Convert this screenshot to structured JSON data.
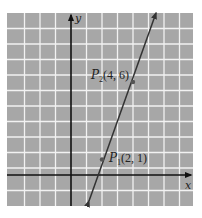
{
  "figure": {
    "type": "coordinate-plane-line",
    "colors": {
      "grid_background": "#a7a7a7",
      "grid_lines": "#f2f2f2",
      "axes": "#111111",
      "line": "#333333",
      "point": "#555555",
      "text": "#222222"
    },
    "axes": {
      "x_label": "x",
      "y_label": "y",
      "x_range": [
        -4,
        8
      ],
      "y_range": [
        -2,
        10
      ],
      "grid_step": 1
    },
    "points": [
      {
        "name": "P",
        "subscript": "1",
        "coords": "(2, 1)",
        "x": 2,
        "y": 1
      },
      {
        "name": "P",
        "subscript": "2",
        "coords": "(4, 6)",
        "x": 4,
        "y": 6
      }
    ],
    "line": {
      "through": [
        "P1",
        "P2"
      ],
      "slope": 2.5
    }
  }
}
